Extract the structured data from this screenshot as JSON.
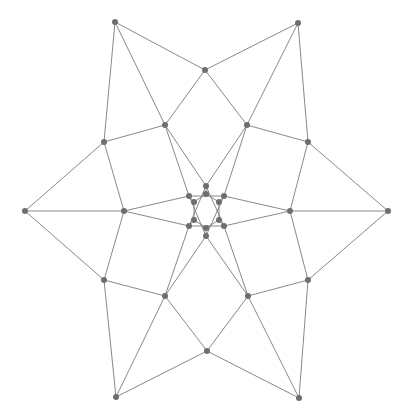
{
  "figure": {
    "name": "symmetric-graph-drawing",
    "title": "",
    "background_color": "#ffffff",
    "width": 413,
    "height": 418
  },
  "style": {
    "edge_color": "#7a7a7a",
    "edge_width": 0.9,
    "node_color": "#6e6e6e",
    "node_radius": 3.0,
    "node_shape": "circle"
  },
  "chart_data": {
    "type": "scatter",
    "title": "",
    "xlabel": "",
    "ylabel": "",
    "symmetry_order": 6,
    "center": [
      206.5,
      211.0
    ],
    "xlim": [
      0,
      413
    ],
    "ylim": [
      0,
      418
    ],
    "grid": false,
    "legend": null,
    "node_count": 30,
    "edge_count": 48,
    "rings": [
      {
        "name": "outer-tips",
        "count": 6,
        "radius": 188,
        "angles_deg": [
          0,
          60,
          120,
          180,
          240,
          300
        ]
      },
      {
        "name": "outer-star-points",
        "count": 6,
        "radius": 194,
        "angles_deg": [
          30,
          90,
          150,
          210,
          270,
          330
        ]
      },
      {
        "name": "mid-ring",
        "count": 6,
        "radius": 120,
        "angles_deg": [
          30,
          90,
          150,
          210,
          270,
          330
        ]
      },
      {
        "name": "inner-spikes",
        "count": 6,
        "radius": 90,
        "angles_deg": [
          0,
          60,
          120,
          180,
          240,
          300
        ]
      },
      {
        "name": "near-center",
        "count": 6,
        "radius": 22,
        "angles_deg": [
          30,
          90,
          150,
          210,
          270,
          330
        ]
      }
    ],
    "nodes": [
      {
        "id": "t0",
        "label": "",
        "x": 388,
        "y": 211
      },
      {
        "id": "t1",
        "label": "",
        "x": 298,
        "y": 23
      },
      {
        "id": "t2",
        "label": "",
        "x": 115,
        "y": 22
      },
      {
        "id": "t3",
        "label": "",
        "x": 25,
        "y": 211
      },
      {
        "id": "t4",
        "label": "",
        "x": 116,
        "y": 397
      },
      {
        "id": "t5",
        "label": "",
        "x": 299,
        "y": 398
      },
      {
        "id": "s0",
        "label": "",
        "x": 308,
        "y": 280
      },
      {
        "id": "s1",
        "label": "",
        "x": 207,
        "y": 351
      },
      {
        "id": "s2",
        "label": "",
        "x": 104,
        "y": 280
      },
      {
        "id": "s3",
        "label": "",
        "x": 104,
        "y": 142
      },
      {
        "id": "s4",
        "label": "",
        "x": 205,
        "y": 70
      },
      {
        "id": "s5",
        "label": "",
        "x": 308,
        "y": 142
      },
      {
        "id": "m0",
        "label": "",
        "x": 290,
        "y": 211
      },
      {
        "id": "m1",
        "label": "",
        "x": 247,
        "y": 125
      },
      {
        "id": "m2",
        "label": "",
        "x": 165,
        "y": 125
      },
      {
        "id": "m3",
        "label": "",
        "x": 124,
        "y": 211
      },
      {
        "id": "m4",
        "label": "",
        "x": 165,
        "y": 296
      },
      {
        "id": "m5",
        "label": "",
        "x": 248,
        "y": 296
      },
      {
        "id": "c0",
        "label": "",
        "x": 224,
        "y": 196
      },
      {
        "id": "c1",
        "label": "",
        "x": 206,
        "y": 186
      },
      {
        "id": "c2",
        "label": "",
        "x": 189,
        "y": 196
      },
      {
        "id": "c3",
        "label": "",
        "x": 189,
        "y": 226
      },
      {
        "id": "c4",
        "label": "",
        "x": 206,
        "y": 236
      },
      {
        "id": "c5",
        "label": "",
        "x": 224,
        "y": 226
      },
      {
        "id": "h0",
        "label": "",
        "x": 219,
        "y": 202
      },
      {
        "id": "h1",
        "label": "",
        "x": 206,
        "y": 194
      },
      {
        "id": "h2",
        "label": "",
        "x": 194,
        "y": 202
      },
      {
        "id": "h3",
        "label": "",
        "x": 194,
        "y": 220
      },
      {
        "id": "h4",
        "label": "",
        "x": 206,
        "y": 228
      },
      {
        "id": "h5",
        "label": "",
        "x": 219,
        "y": 220
      }
    ],
    "edges": [
      [
        "t0",
        "s5"
      ],
      [
        "t0",
        "s0"
      ],
      [
        "t0",
        "m0"
      ],
      [
        "t1",
        "s4"
      ],
      [
        "t1",
        "s5"
      ],
      [
        "t1",
        "m1"
      ],
      [
        "t2",
        "s3"
      ],
      [
        "t2",
        "s4"
      ],
      [
        "t2",
        "m2"
      ],
      [
        "t3",
        "s2"
      ],
      [
        "t3",
        "s3"
      ],
      [
        "t3",
        "m3"
      ],
      [
        "t4",
        "s1"
      ],
      [
        "t4",
        "s2"
      ],
      [
        "t4",
        "m4"
      ],
      [
        "t5",
        "s0"
      ],
      [
        "t5",
        "s1"
      ],
      [
        "t5",
        "m5"
      ],
      [
        "s0",
        "m0"
      ],
      [
        "s0",
        "m5"
      ],
      [
        "s1",
        "m5"
      ],
      [
        "s1",
        "m4"
      ],
      [
        "s2",
        "m4"
      ],
      [
        "s2",
        "m3"
      ],
      [
        "s3",
        "m3"
      ],
      [
        "s3",
        "m2"
      ],
      [
        "s4",
        "m2"
      ],
      [
        "s4",
        "m1"
      ],
      [
        "s5",
        "m1"
      ],
      [
        "s5",
        "m0"
      ],
      [
        "m0",
        "c0"
      ],
      [
        "m0",
        "c5"
      ],
      [
        "m1",
        "c1"
      ],
      [
        "m1",
        "c0"
      ],
      [
        "m2",
        "c2"
      ],
      [
        "m2",
        "c1"
      ],
      [
        "m3",
        "c2"
      ],
      [
        "m3",
        "c3"
      ],
      [
        "m4",
        "c3"
      ],
      [
        "m4",
        "c4"
      ],
      [
        "m5",
        "c4"
      ],
      [
        "m5",
        "c5"
      ],
      [
        "c0",
        "h0"
      ],
      [
        "c1",
        "h1"
      ],
      [
        "c2",
        "h2"
      ],
      [
        "c3",
        "h3"
      ],
      [
        "c4",
        "h4"
      ],
      [
        "c5",
        "h5"
      ],
      [
        "h0",
        "h1"
      ],
      [
        "h1",
        "h2"
      ],
      [
        "h2",
        "h3"
      ],
      [
        "h3",
        "h4"
      ],
      [
        "h4",
        "h5"
      ],
      [
        "h5",
        "h0"
      ],
      [
        "c0",
        "c2"
      ],
      [
        "c2",
        "c4"
      ],
      [
        "c4",
        "c0"
      ],
      [
        "c1",
        "c3"
      ],
      [
        "c3",
        "c5"
      ],
      [
        "c5",
        "c1"
      ]
    ]
  }
}
